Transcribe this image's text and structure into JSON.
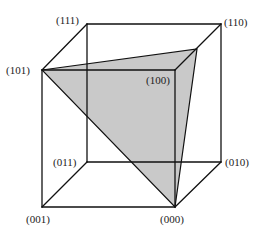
{
  "diagram": {
    "type": "boolean-cube",
    "vertices": [
      {
        "id": "000",
        "label": "(000)",
        "x": 175,
        "y": 207,
        "lx": 160,
        "ly": 223
      },
      {
        "id": "001",
        "label": "(001)",
        "x": 42,
        "y": 207,
        "lx": 26,
        "ly": 223
      },
      {
        "id": "010",
        "label": "(010)",
        "x": 221,
        "y": 162,
        "lx": 225,
        "ly": 166
      },
      {
        "id": "011",
        "label": "(011)",
        "x": 87,
        "y": 162,
        "lx": 53,
        "ly": 166
      },
      {
        "id": "100",
        "label": "(100)",
        "x": 175,
        "y": 70,
        "lx": 146,
        "ly": 84
      },
      {
        "id": "101",
        "label": "(101)",
        "x": 42,
        "y": 70,
        "lx": 6,
        "ly": 74
      },
      {
        "id": "110",
        "label": "(110)",
        "x": 221,
        "y": 24,
        "lx": 224,
        "ly": 26
      },
      {
        "id": "111",
        "label": "(111)",
        "x": 87,
        "y": 24,
        "lx": 56,
        "ly": 24
      }
    ],
    "shaded_plane": {
      "points": [
        [
          42,
          70
        ],
        [
          197,
          49
        ],
        [
          175,
          207
        ]
      ],
      "fill": "#c9c9c9"
    },
    "edge_color": "#111111"
  }
}
